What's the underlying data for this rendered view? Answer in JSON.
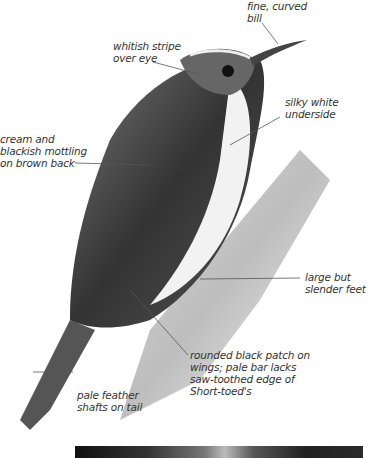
{
  "plate": {
    "subject": "Treecreeper illustration",
    "labels": [
      {
        "id": "bill",
        "text": "fine, curved\nbill"
      },
      {
        "id": "eye-stripe",
        "text": "whitish stripe\nover eye"
      },
      {
        "id": "underside",
        "text": "silky white\nunderside"
      },
      {
        "id": "back",
        "text": "cream and\nblackish mottling\non brown back"
      },
      {
        "id": "feet",
        "text": "large but\nslender feet"
      },
      {
        "id": "wing-patch",
        "text": "rounded black patch on\nwings; pale bar lacks\nsaw-toothed edge of\nShort-toed's"
      },
      {
        "id": "tail",
        "text": "pale feather\nshafts on tail"
      }
    ]
  }
}
